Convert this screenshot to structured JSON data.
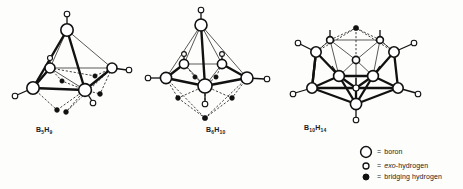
{
  "figure": {
    "type": "chemical-structure-diagram"
  },
  "structures": [
    {
      "id": "b5h9",
      "formula_plain": "B5H9",
      "formula_base": "B",
      "sub1": "5",
      "formula_mid": "H",
      "sub2": "9",
      "label_x": 36,
      "label_y": 130,
      "geometry": "square pyramid",
      "boron_count": 5,
      "exo_hydrogen_count": 5,
      "bridging_hydrogen_count": 4
    },
    {
      "id": "b6h10",
      "formula_plain": "B6H10",
      "formula_base": "B",
      "sub1": "6",
      "formula_mid": "H",
      "sub2": "10",
      "label_x": 206,
      "label_y": 130,
      "geometry": "pentagonal pyramid",
      "boron_count": 6,
      "exo_hydrogen_count": 6,
      "bridging_hydrogen_count": 4
    },
    {
      "id": "b10h14",
      "formula_plain": "B10H14",
      "formula_base": "B",
      "sub1": "10",
      "formula_mid": "H",
      "sub2": "14",
      "label_x": 304,
      "label_y": 124,
      "geometry": "decaborane cage",
      "boron_count": 10,
      "exo_hydrogen_count": 10,
      "bridging_hydrogen_count": 4
    }
  ],
  "legend": {
    "items": [
      {
        "marker": "large-open-circle",
        "equals": "=",
        "label": "boron",
        "label_italic_prefix": "",
        "label_rest": "boron"
      },
      {
        "marker": "small-open-circle",
        "equals": "=",
        "label": "exo-hydrogen",
        "label_italic_prefix": "exo",
        "label_rest": "-hydrogen"
      },
      {
        "marker": "small-filled-circle",
        "equals": "=",
        "label": "bridging hydrogen",
        "label_italic_prefix": "",
        "label_rest": "bridging hydrogen"
      }
    ]
  },
  "colors": {
    "ink": "#111111",
    "paper": "#fdfdfb",
    "boron_fill": "#ffffff",
    "bridging_fill": "#111111"
  }
}
